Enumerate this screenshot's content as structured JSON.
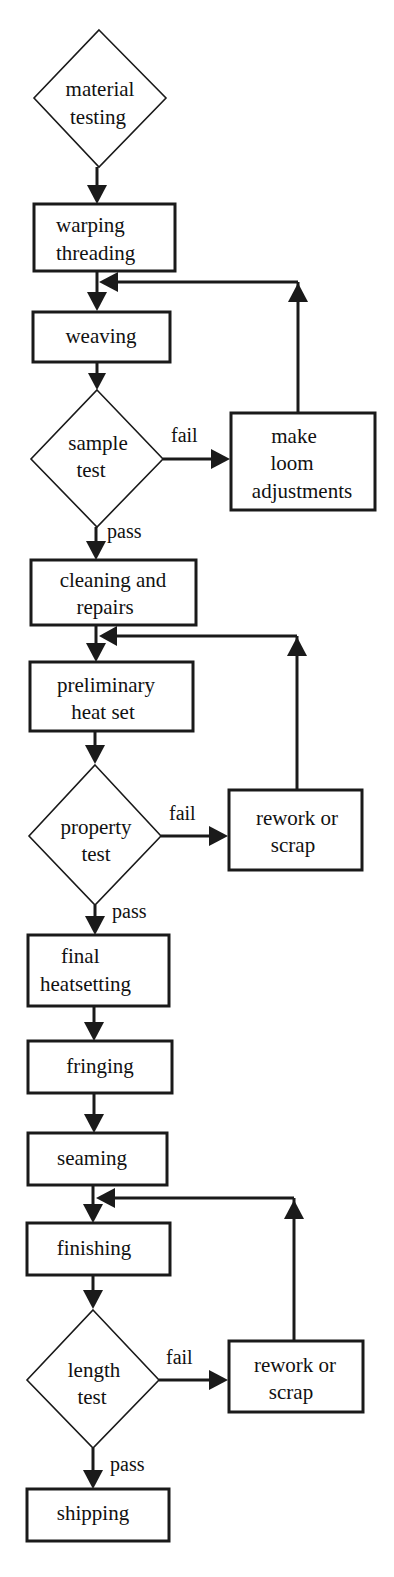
{
  "diagram": {
    "type": "flowchart",
    "nodes": {
      "material_testing": {
        "shape": "diamond",
        "lines": [
          "material",
          "testing"
        ]
      },
      "warping_threading": {
        "shape": "box",
        "lines": [
          "warping",
          "threading"
        ]
      },
      "weaving": {
        "shape": "box",
        "lines": [
          "weaving"
        ]
      },
      "sample_test": {
        "shape": "diamond",
        "lines": [
          "sample",
          "test"
        ]
      },
      "make_loom_adjustments": {
        "shape": "box",
        "lines": [
          "make",
          "loom",
          "adjustments"
        ]
      },
      "cleaning_repairs": {
        "shape": "box",
        "lines": [
          "cleaning and",
          "repairs"
        ]
      },
      "preliminary_heat_set": {
        "shape": "box",
        "lines": [
          "preliminary",
          "heat set"
        ]
      },
      "property_test": {
        "shape": "diamond",
        "lines": [
          "property",
          "test"
        ]
      },
      "rework_scrap_1": {
        "shape": "box",
        "lines": [
          "rework or",
          "scrap"
        ]
      },
      "final_heatsetting": {
        "shape": "box",
        "lines": [
          "final",
          "heatsetting"
        ]
      },
      "fringing": {
        "shape": "box",
        "lines": [
          "fringing"
        ]
      },
      "seaming": {
        "shape": "box",
        "lines": [
          "seaming"
        ]
      },
      "finishing": {
        "shape": "box",
        "lines": [
          "finishing"
        ]
      },
      "length_test": {
        "shape": "diamond",
        "lines": [
          "length",
          "test"
        ]
      },
      "rework_scrap_2": {
        "shape": "box",
        "lines": [
          "rework or",
          "scrap"
        ]
      },
      "shipping": {
        "shape": "box",
        "lines": [
          "shipping"
        ]
      }
    },
    "edge_labels": {
      "fail": "fail",
      "pass": "pass"
    },
    "edges": [
      {
        "from": "material testing",
        "to": "warping threading"
      },
      {
        "from": "warping threading",
        "to": "weaving"
      },
      {
        "from": "weaving",
        "to": "sample test"
      },
      {
        "from": "sample test",
        "to": "make loom adjustments",
        "label": "fail"
      },
      {
        "from": "make loom adjustments",
        "to": "weaving"
      },
      {
        "from": "sample test",
        "to": "cleaning and repairs",
        "label": "pass"
      },
      {
        "from": "cleaning and repairs",
        "to": "preliminary heat set"
      },
      {
        "from": "preliminary heat set",
        "to": "property test"
      },
      {
        "from": "property test",
        "to": "rework or scrap",
        "label": "fail"
      },
      {
        "from": "rework or scrap",
        "to": "preliminary heat set"
      },
      {
        "from": "property test",
        "to": "final heatsetting",
        "label": "pass"
      },
      {
        "from": "final heatsetting",
        "to": "fringing"
      },
      {
        "from": "fringing",
        "to": "seaming"
      },
      {
        "from": "seaming",
        "to": "finishing"
      },
      {
        "from": "finishing",
        "to": "length test"
      },
      {
        "from": "length test",
        "to": "rework or scrap",
        "label": "fail"
      },
      {
        "from": "rework or scrap",
        "to": "finishing"
      },
      {
        "from": "length test",
        "to": "shipping",
        "label": "pass"
      }
    ]
  }
}
